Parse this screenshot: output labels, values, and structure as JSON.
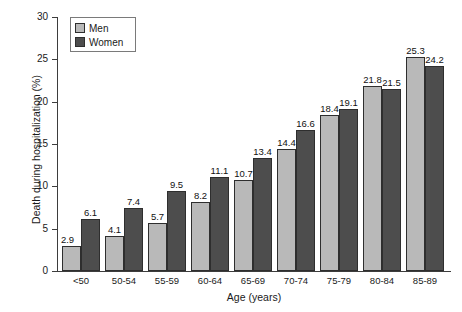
{
  "chart_data": {
    "type": "bar",
    "title": "",
    "xlabel": "Age (years)",
    "ylabel": "Death during hospitalization (%)",
    "ylim": [
      0,
      30
    ],
    "ytick_step": 5,
    "yticks": [
      0,
      5,
      10,
      15,
      20,
      25,
      30
    ],
    "grid": false,
    "legend_position": "top-left",
    "categories": [
      "<50",
      "50-54",
      "55-59",
      "60-64",
      "65-69",
      "70-74",
      "75-79",
      "80-84",
      "85-89"
    ],
    "series": [
      {
        "name": "Men",
        "color": "#b9b9b9",
        "values": [
          2.9,
          4.1,
          5.7,
          8.2,
          10.7,
          14.4,
          18.4,
          21.8,
          25.3
        ]
      },
      {
        "name": "Women",
        "color": "#4d4d4d",
        "values": [
          6.1,
          7.4,
          9.5,
          11.1,
          13.4,
          16.6,
          19.1,
          21.5,
          24.2
        ]
      }
    ],
    "data_labels": {
      "men": [
        "2.9",
        "4.1",
        "5.7",
        "8.2",
        "10.7",
        "14.4",
        "18.4",
        "21.8",
        "25.3"
      ],
      "women": [
        "6.1",
        "7.4",
        "9.5",
        "11.1",
        "13.4",
        "16.6",
        "19.1",
        "21.5",
        "24.2"
      ]
    },
    "ytick_labels": [
      "0",
      "5",
      "10",
      "15",
      "20",
      "25",
      "30"
    ]
  },
  "legend": {
    "items": [
      {
        "label": "Men"
      },
      {
        "label": "Women"
      }
    ]
  }
}
